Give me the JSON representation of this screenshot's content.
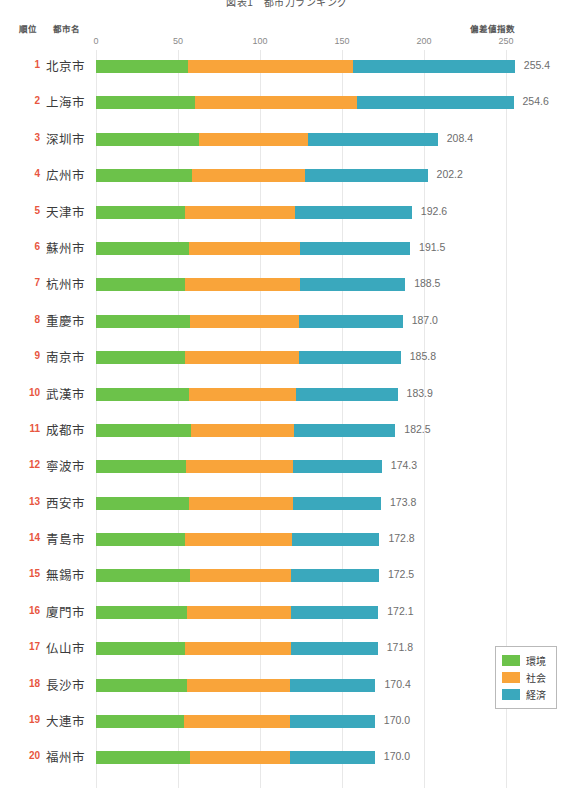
{
  "chart_data": {
    "type": "bar",
    "subtype": "stacked-horizontal",
    "title": "図表1　都市力ランキング",
    "xlabel": "偏差値指数",
    "ylabel": "",
    "grid": true,
    "legend_position": "bottom-right",
    "xlim": [
      0,
      260
    ],
    "axis_ticks": [
      0,
      50,
      100,
      150,
      200,
      250
    ],
    "axis_tick_labels": [
      "0",
      "50",
      "100",
      "150",
      "200",
      "250"
    ],
    "columns": {
      "rank": "順位",
      "city": "都市名",
      "index": "偏差値指数"
    },
    "series": [
      {
        "name": "環境",
        "color": "#6cc24a",
        "values": [
          56.0,
          60.5,
          63.0,
          58.5,
          54.5,
          57.0,
          54.0,
          57.5,
          54.5,
          56.5,
          58.0,
          55.0,
          56.5,
          54.0,
          57.5,
          55.5,
          54.0,
          55.5,
          53.5,
          57.5
        ]
      },
      {
        "name": "社会",
        "color": "#f9a43a",
        "values": [
          100.5,
          98.5,
          66.5,
          69.0,
          67.0,
          67.5,
          70.5,
          66.5,
          69.0,
          65.5,
          62.5,
          65.0,
          63.5,
          65.5,
          61.5,
          63.5,
          65.0,
          62.5,
          64.5,
          60.5
        ]
      },
      {
        "name": "経済",
        "color": "#3aa8bd",
        "values": [
          98.9,
          95.6,
          78.9,
          74.7,
          71.1,
          67.0,
          64.0,
          63.0,
          62.3,
          61.9,
          62.0,
          54.3,
          53.8,
          53.3,
          53.5,
          53.1,
          52.8,
          52.4,
          52.0,
          52.0
        ]
      }
    ],
    "categories": [
      "北京市",
      "上海市",
      "深圳市",
      "広州市",
      "天津市",
      "蘇州市",
      "杭州市",
      "重慶市",
      "南京市",
      "武漢市",
      "成都市",
      "寧波市",
      "西安市",
      "青島市",
      "無錫市",
      "廈門市",
      "仏山市",
      "長沙市",
      "大連市",
      "福州市"
    ],
    "rows": [
      {
        "rank": "1",
        "city": "北京市",
        "total": "255.4",
        "env": 56.0,
        "soc": 100.5,
        "eco": 98.9
      },
      {
        "rank": "2",
        "city": "上海市",
        "total": "254.6",
        "env": 60.5,
        "soc": 98.5,
        "eco": 95.6
      },
      {
        "rank": "3",
        "city": "深圳市",
        "total": "208.4",
        "env": 63.0,
        "soc": 66.5,
        "eco": 78.9
      },
      {
        "rank": "4",
        "city": "広州市",
        "total": "202.2",
        "env": 58.5,
        "soc": 69.0,
        "eco": 74.7
      },
      {
        "rank": "5",
        "city": "天津市",
        "total": "192.6",
        "env": 54.5,
        "soc": 67.0,
        "eco": 71.1
      },
      {
        "rank": "6",
        "city": "蘇州市",
        "total": "191.5",
        "env": 57.0,
        "soc": 67.5,
        "eco": 67.0
      },
      {
        "rank": "7",
        "city": "杭州市",
        "total": "188.5",
        "env": 54.0,
        "soc": 70.5,
        "eco": 64.0
      },
      {
        "rank": "8",
        "city": "重慶市",
        "total": "187.0",
        "env": 57.5,
        "soc": 66.5,
        "eco": 63.0
      },
      {
        "rank": "9",
        "city": "南京市",
        "total": "185.8",
        "env": 54.5,
        "soc": 69.0,
        "eco": 62.3
      },
      {
        "rank": "10",
        "city": "武漢市",
        "total": "183.9",
        "env": 56.5,
        "soc": 65.5,
        "eco": 61.9
      },
      {
        "rank": "11",
        "city": "成都市",
        "total": "182.5",
        "env": 58.0,
        "soc": 62.5,
        "eco": 62.0
      },
      {
        "rank": "12",
        "city": "寧波市",
        "total": "174.3",
        "env": 55.0,
        "soc": 65.0,
        "eco": 54.3
      },
      {
        "rank": "13",
        "city": "西安市",
        "total": "173.8",
        "env": 56.5,
        "soc": 63.5,
        "eco": 53.8
      },
      {
        "rank": "14",
        "city": "青島市",
        "total": "172.8",
        "env": 54.0,
        "soc": 65.5,
        "eco": 53.3
      },
      {
        "rank": "15",
        "city": "無錫市",
        "total": "172.5",
        "env": 57.5,
        "soc": 61.5,
        "eco": 53.5
      },
      {
        "rank": "16",
        "city": "廈門市",
        "total": "172.1",
        "env": 55.5,
        "soc": 63.5,
        "eco": 53.1
      },
      {
        "rank": "17",
        "city": "仏山市",
        "total": "171.8",
        "env": 54.0,
        "soc": 65.0,
        "eco": 52.8
      },
      {
        "rank": "18",
        "city": "長沙市",
        "total": "170.4",
        "env": 55.5,
        "soc": 62.5,
        "eco": 52.4
      },
      {
        "rank": "19",
        "city": "大連市",
        "total": "170.0",
        "env": 53.5,
        "soc": 64.5,
        "eco": 52.0
      },
      {
        "rank": "20",
        "city": "福州市",
        "total": "170.0",
        "env": 57.5,
        "soc": 60.5,
        "eco": 52.0
      }
    ],
    "legend": [
      {
        "label": "環境",
        "color": "#6cc24a"
      },
      {
        "label": "社会",
        "color": "#f9a43a"
      },
      {
        "label": "経済",
        "color": "#3aa8bd"
      }
    ]
  }
}
